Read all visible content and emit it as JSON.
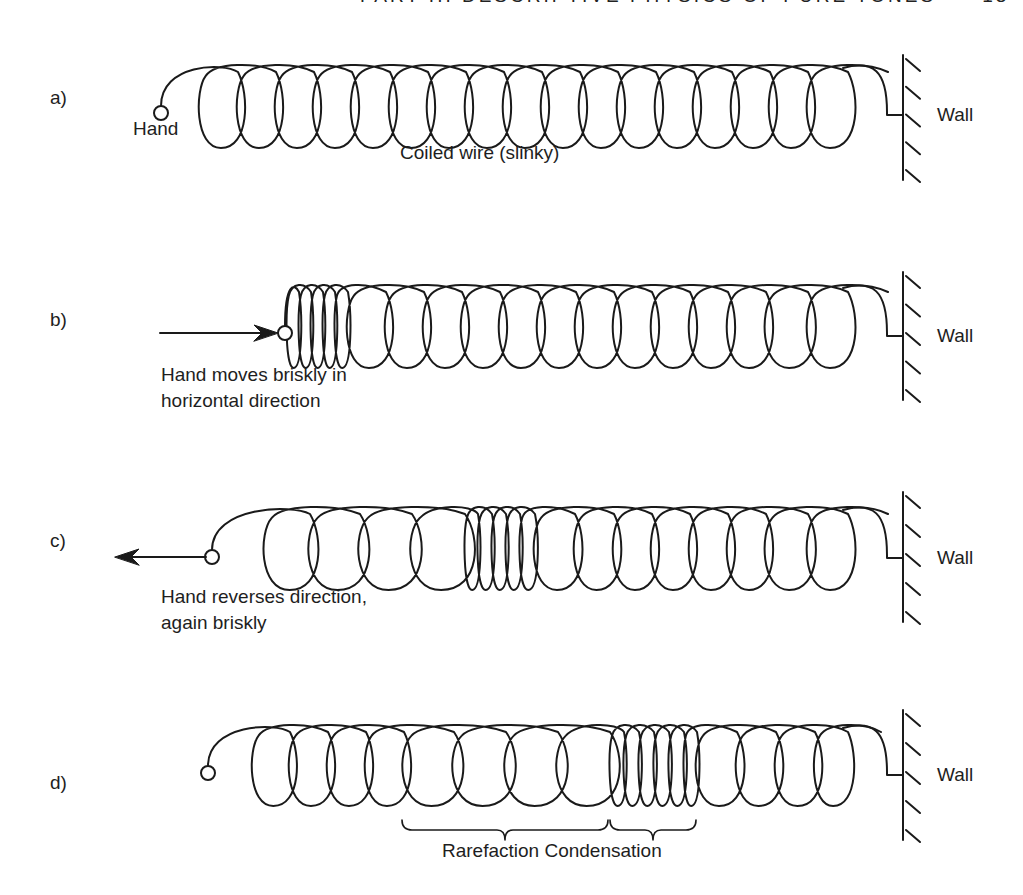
{
  "header": {
    "running_title": "PART III  DESCRIPTIVE PHYSICS OF PURE TONES",
    "page_number": "13"
  },
  "style": {
    "ink": "#1a1a1a",
    "background": "#ffffff",
    "stroke_width": 2
  },
  "wall_label": "Wall",
  "panels": [
    {
      "id": "a",
      "label": "a)",
      "label_pos": [
        50,
        105
      ],
      "coil": {
        "top": 66,
        "bottom": 148,
        "loops": [
          [
            200,
            238
          ],
          [
            238,
            276
          ],
          [
            276,
            314
          ],
          [
            314,
            352
          ],
          [
            352,
            390
          ],
          [
            390,
            428
          ],
          [
            428,
            466
          ],
          [
            466,
            504
          ],
          [
            504,
            542
          ],
          [
            542,
            580
          ],
          [
            580,
            618
          ],
          [
            618,
            656
          ],
          [
            656,
            694
          ],
          [
            694,
            732
          ],
          [
            732,
            770
          ],
          [
            770,
            808
          ],
          [
            808,
            848
          ]
        ]
      },
      "hand": {
        "x": 161,
        "y": 113
      },
      "wall": {
        "x": 903,
        "top": 55,
        "bottom": 180,
        "attach_y": 115,
        "tail_x": 887
      },
      "arrow": null,
      "texts": [
        {
          "name": "hand-label",
          "text": "Hand",
          "x": 133,
          "y": 136
        },
        {
          "name": "coil-label",
          "text": "Coiled wire (slinky)",
          "x": 400,
          "y": 160
        }
      ],
      "braces": []
    },
    {
      "id": "b",
      "label": "b)",
      "label_pos": [
        50,
        327
      ],
      "coil": {
        "top": 286,
        "bottom": 368,
        "loops": [
          [
            287,
            299
          ],
          [
            299,
            311
          ],
          [
            311,
            323
          ],
          [
            323,
            335
          ],
          [
            335,
            348
          ],
          [
            348,
            386
          ],
          [
            386,
            424
          ],
          [
            424,
            462
          ],
          [
            462,
            500
          ],
          [
            500,
            538
          ],
          [
            538,
            576
          ],
          [
            576,
            614
          ],
          [
            614,
            652
          ],
          [
            652,
            690
          ],
          [
            690,
            728
          ],
          [
            728,
            766
          ],
          [
            766,
            808
          ],
          [
            808,
            848
          ]
        ]
      },
      "hand": {
        "x": 285,
        "y": 333
      },
      "wall": {
        "x": 903,
        "top": 272,
        "bottom": 400,
        "attach_y": 336,
        "tail_x": 887
      },
      "arrow": {
        "from": 160,
        "to": 278,
        "y": 333,
        "dir": "right"
      },
      "texts": [
        {
          "name": "action-label-line1",
          "text": "Hand moves briskly in",
          "x": 161,
          "y": 382
        },
        {
          "name": "action-label-line2",
          "text": "horizontal direction",
          "x": 161,
          "y": 408
        }
      ],
      "braces": []
    },
    {
      "id": "c",
      "label": "c)",
      "label_pos": [
        50,
        548
      ],
      "coil": {
        "top": 508,
        "bottom": 590,
        "loops": [
          [
            265,
            310
          ],
          [
            310,
            360
          ],
          [
            360,
            412
          ],
          [
            412,
            465
          ],
          [
            465,
            478
          ],
          [
            478,
            492
          ],
          [
            492,
            506
          ],
          [
            506,
            520
          ],
          [
            520,
            535
          ],
          [
            535,
            575
          ],
          [
            575,
            614
          ],
          [
            614,
            652
          ],
          [
            652,
            690
          ],
          [
            690,
            728
          ],
          [
            728,
            766
          ],
          [
            766,
            808
          ],
          [
            808,
            848
          ]
        ]
      },
      "hand": {
        "x": 212,
        "y": 557
      },
      "wall": {
        "x": 903,
        "top": 492,
        "bottom": 622,
        "attach_y": 558,
        "tail_x": 887
      },
      "arrow": {
        "from": 206,
        "to": 115,
        "y": 557,
        "dir": "left"
      },
      "texts": [
        {
          "name": "action-label-line1",
          "text": "Hand reverses direction,",
          "x": 161,
          "y": 604
        },
        {
          "name": "action-label-line2",
          "text": "again briskly",
          "x": 161,
          "y": 630
        }
      ],
      "braces": []
    },
    {
      "id": "d",
      "label": "d)",
      "label_pos": [
        50,
        790
      ],
      "coil": {
        "top": 726,
        "bottom": 806,
        "loops": [
          [
            253,
            290
          ],
          [
            290,
            328
          ],
          [
            328,
            366
          ],
          [
            366,
            404
          ],
          [
            404,
            454
          ],
          [
            454,
            506
          ],
          [
            506,
            558
          ],
          [
            558,
            610
          ],
          [
            610,
            624
          ],
          [
            624,
            639
          ],
          [
            639,
            654
          ],
          [
            654,
            669
          ],
          [
            669,
            684
          ],
          [
            684,
            697
          ],
          [
            697,
            737
          ],
          [
            737,
            776
          ],
          [
            776,
            815
          ],
          [
            815,
            848
          ]
        ]
      },
      "hand": {
        "x": 208,
        "y": 773
      },
      "wall": {
        "x": 903,
        "top": 710,
        "bottom": 840,
        "attach_y": 775,
        "tail_x": 887
      },
      "arrow": null,
      "texts": [],
      "braces": [
        {
          "name": "rarefaction-brace",
          "from": 402,
          "to": 608,
          "y": 830,
          "label": "Rarefaction"
        },
        {
          "name": "condensation-brace",
          "from": 610,
          "to": 696,
          "y": 830,
          "label": "Condensation"
        }
      ],
      "brace_caption": {
        "text": "Rarefaction Condensation",
        "x": 442,
        "y": 858
      }
    }
  ]
}
